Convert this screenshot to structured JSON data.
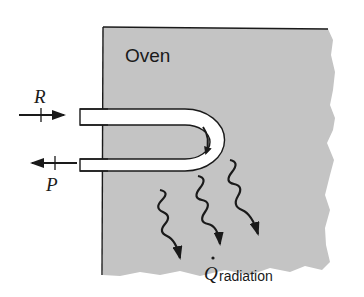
{
  "figure": {
    "oven_label": "Oven",
    "inlet_label": "R",
    "outlet_label": "P",
    "radiation_symbol": "Q",
    "radiation_subscript": "radiation",
    "colors": {
      "oven_fill": "#c4c4c4",
      "outline": "#1a1a1a",
      "tube_fill": "#ffffff",
      "background": "#ffffff"
    }
  }
}
